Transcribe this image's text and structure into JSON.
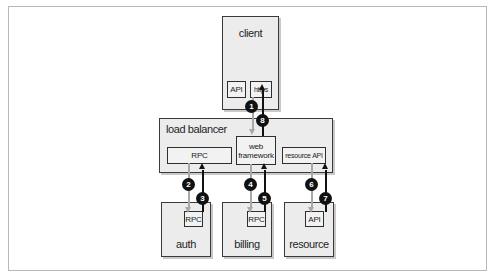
{
  "diagram": {
    "nodes": {
      "client": {
        "label": "client",
        "ports": {
          "api": "API",
          "https": "https"
        }
      },
      "load_balancer": {
        "label": "load balancer",
        "components": {
          "rpc": "RPC",
          "web_framework": "web framework",
          "resource_api": "resource API"
        }
      },
      "auth": {
        "label": "auth",
        "port": "RPC"
      },
      "billing": {
        "label": "billing",
        "port": "RPC"
      },
      "resource": {
        "label": "resource",
        "port": "API"
      }
    },
    "steps": [
      "1",
      "2",
      "3",
      "4",
      "5",
      "6",
      "7",
      "8"
    ],
    "edges": [
      {
        "step": "1",
        "from": "client.https",
        "to": "load_balancer.web_framework",
        "style": "gray-request"
      },
      {
        "step": "2",
        "from": "load_balancer.rpc",
        "to": "auth.rpc",
        "style": "gray-request"
      },
      {
        "step": "3",
        "from": "auth.rpc",
        "to": "load_balancer.rpc",
        "style": "black-response"
      },
      {
        "step": "4",
        "from": "load_balancer.web_framework",
        "to": "billing.rpc",
        "style": "gray-request"
      },
      {
        "step": "5",
        "from": "billing.rpc",
        "to": "load_balancer.web_framework",
        "style": "black-response"
      },
      {
        "step": "6",
        "from": "load_balancer.resource_api",
        "to": "resource.api",
        "style": "gray-request"
      },
      {
        "step": "7",
        "from": "resource.api",
        "to": "load_balancer.resource_api",
        "style": "black-response"
      },
      {
        "step": "8",
        "from": "load_balancer.web_framework",
        "to": "client.https",
        "style": "black-response"
      }
    ],
    "colors": {
      "box_fill": "#ececec",
      "border": "#3a3a3a",
      "request_line": "#a8a8a8",
      "response_line": "#111111"
    }
  }
}
